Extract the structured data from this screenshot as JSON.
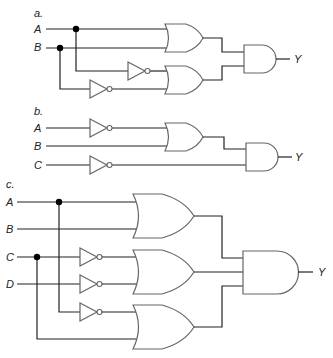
{
  "diagram": {
    "type": "logic-circuit-schematics",
    "parts": [
      {
        "label": "a.",
        "inputs": [
          "A",
          "B"
        ],
        "output": "Y",
        "gates": [
          {
            "type": "NOT",
            "input": "A"
          },
          {
            "type": "NOT",
            "input": "B"
          },
          {
            "type": "OR",
            "inputs": [
              "A",
              "B"
            ]
          },
          {
            "type": "OR",
            "inputs": [
              "NOT A",
              "NOT B"
            ]
          },
          {
            "type": "AND",
            "inputs": [
              "OR1",
              "OR2"
            ],
            "output": "Y"
          }
        ]
      },
      {
        "label": "b.",
        "inputs": [
          "A",
          "B",
          "C"
        ],
        "output": "Y",
        "gates": [
          {
            "type": "NOT",
            "input": "A"
          },
          {
            "type": "NOT",
            "input": "C"
          },
          {
            "type": "OR",
            "inputs": [
              "NOT A",
              "B"
            ]
          },
          {
            "type": "AND",
            "inputs": [
              "OR1",
              "NOT C"
            ],
            "output": "Y"
          }
        ]
      },
      {
        "label": "c.",
        "inputs": [
          "A",
          "B",
          "C",
          "D"
        ],
        "output": "Y",
        "gates": [
          {
            "type": "NOT",
            "input": "C"
          },
          {
            "type": "NOT",
            "input": "D"
          },
          {
            "type": "NOT",
            "input": "A"
          },
          {
            "type": "OR",
            "inputs": [
              "A",
              "B"
            ]
          },
          {
            "type": "OR",
            "inputs": [
              "NOT C",
              "NOT D"
            ]
          },
          {
            "type": "OR",
            "inputs": [
              "NOT A",
              "C"
            ]
          },
          {
            "type": "AND",
            "inputs": [
              "OR1",
              "OR2",
              "OR3"
            ],
            "output": "Y"
          }
        ]
      }
    ]
  },
  "labels": {
    "a": {
      "part": "a.",
      "A": "A",
      "B": "B",
      "Y": "Y"
    },
    "b": {
      "part": "b.",
      "A": "A",
      "B": "B",
      "C": "C",
      "Y": "Y"
    },
    "c": {
      "part": "c.",
      "A": "A",
      "B": "B",
      "C": "C",
      "D": "D",
      "Y": "Y"
    }
  }
}
